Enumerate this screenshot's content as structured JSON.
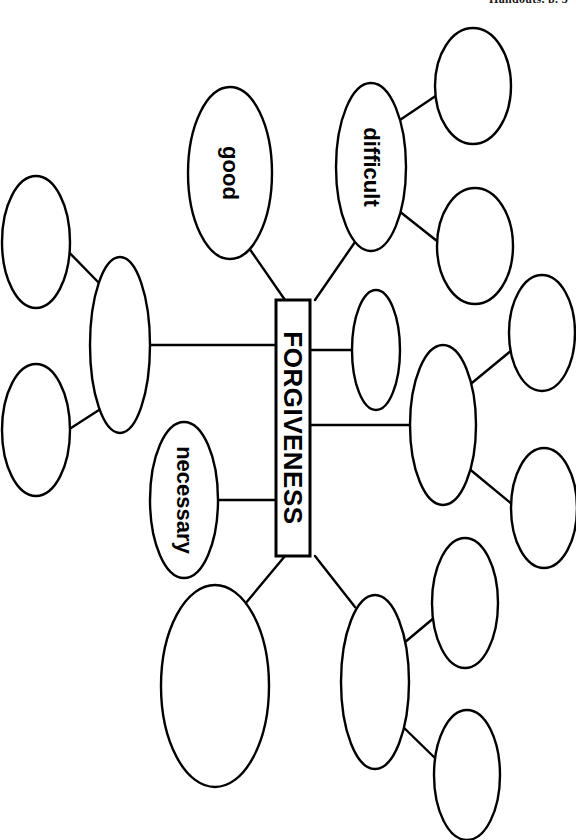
{
  "header": {
    "running_text": "Handouts, p. 3"
  },
  "diagram": {
    "type": "concept-map",
    "title": "FORGIVENESS",
    "orientation": "rotated-90-clockwise",
    "center": {
      "id": "center",
      "label": "FORGIVENESS",
      "shape": "rectangle",
      "x": 293,
      "y": 428,
      "w": 34,
      "h": 256,
      "font_size": 26
    },
    "nodes": [
      {
        "id": "good",
        "label": "good",
        "cx": 230,
        "cy": 173,
        "rx": 42,
        "ry": 86,
        "font_size": 22,
        "filled": false
      },
      {
        "id": "difficult",
        "label": "difficult",
        "cx": 371,
        "cy": 167,
        "rx": 35,
        "ry": 84,
        "font_size": 22,
        "filled": false
      },
      {
        "id": "necessary",
        "label": "necessary",
        "cx": 184,
        "cy": 500,
        "rx": 34,
        "ry": 78,
        "font_size": 22,
        "filled": false
      },
      {
        "id": "d1",
        "label": "",
        "cx": 473,
        "cy": 86,
        "rx": 38,
        "ry": 58,
        "font_size": 0,
        "filled": false
      },
      {
        "id": "d2",
        "label": "",
        "cx": 475,
        "cy": 246,
        "rx": 38,
        "ry": 58,
        "font_size": 0,
        "filled": false
      },
      {
        "id": "l1",
        "label": "",
        "cx": 120,
        "cy": 345,
        "rx": 30,
        "ry": 88,
        "font_size": 0,
        "filled": false
      },
      {
        "id": "l2",
        "label": "",
        "cx": 36,
        "cy": 242,
        "rx": 34,
        "ry": 66,
        "font_size": 0,
        "filled": false
      },
      {
        "id": "l3",
        "label": "",
        "cx": 36,
        "cy": 430,
        "rx": 34,
        "ry": 66,
        "font_size": 0,
        "filled": false
      },
      {
        "id": "r1",
        "label": "",
        "cx": 376,
        "cy": 350,
        "rx": 24,
        "ry": 60,
        "font_size": 0,
        "filled": false
      },
      {
        "id": "r2",
        "label": "",
        "cx": 443,
        "cy": 425,
        "rx": 33,
        "ry": 80,
        "font_size": 0,
        "filled": false
      },
      {
        "id": "r3",
        "label": "",
        "cx": 542,
        "cy": 333,
        "rx": 33,
        "ry": 58,
        "font_size": 0,
        "filled": false
      },
      {
        "id": "r4",
        "label": "",
        "cx": 544,
        "cy": 508,
        "rx": 33,
        "ry": 60,
        "font_size": 0,
        "filled": false
      },
      {
        "id": "b1",
        "label": "",
        "cx": 215,
        "cy": 686,
        "rx": 54,
        "ry": 101,
        "font_size": 0,
        "filled": false
      },
      {
        "id": "b2",
        "label": "",
        "cx": 375,
        "cy": 682,
        "rx": 34,
        "ry": 87,
        "font_size": 0,
        "filled": false
      },
      {
        "id": "b3",
        "label": "",
        "cx": 465,
        "cy": 603,
        "rx": 33,
        "ry": 65,
        "font_size": 0,
        "filled": false
      },
      {
        "id": "b4",
        "label": "",
        "cx": 467,
        "cy": 775,
        "rx": 33,
        "ry": 65,
        "font_size": 0,
        "filled": false
      }
    ],
    "edges": [
      {
        "from": "center",
        "to": "good",
        "x1": 285,
        "y1": 300,
        "x2": 249,
        "y2": 248
      },
      {
        "from": "center",
        "to": "difficult",
        "x1": 315,
        "y1": 300,
        "x2": 355,
        "y2": 242
      },
      {
        "from": "center",
        "to": "l1",
        "x1": 276,
        "y1": 345,
        "x2": 150,
        "y2": 345
      },
      {
        "from": "center",
        "to": "necessary",
        "x1": 276,
        "y1": 500,
        "x2": 216,
        "y2": 500
      },
      {
        "from": "center",
        "to": "b1",
        "x1": 285,
        "y1": 556,
        "x2": 245,
        "y2": 604
      },
      {
        "from": "center",
        "to": "b2",
        "x1": 315,
        "y1": 556,
        "x2": 355,
        "y2": 607
      },
      {
        "from": "center",
        "to": "r1",
        "x1": 310,
        "y1": 350,
        "x2": 352,
        "y2": 350
      },
      {
        "from": "center",
        "to": "r2",
        "x1": 310,
        "y1": 425,
        "x2": 410,
        "y2": 425
      },
      {
        "from": "difficult",
        "to": "d1",
        "x1": 394,
        "y1": 124,
        "x2": 443,
        "y2": 91
      },
      {
        "from": "difficult",
        "to": "d2",
        "x1": 394,
        "y1": 207,
        "x2": 442,
        "y2": 245
      },
      {
        "from": "l1",
        "to": "l2",
        "x1": 99,
        "y1": 283,
        "x2": 57,
        "y2": 240
      },
      {
        "from": "l1",
        "to": "l3",
        "x1": 99,
        "y1": 410,
        "x2": 57,
        "y2": 437
      },
      {
        "from": "r2",
        "to": "r3",
        "x1": 467,
        "y1": 387,
        "x2": 512,
        "y2": 350
      },
      {
        "from": "r2",
        "to": "r4",
        "x1": 467,
        "y1": 467,
        "x2": 513,
        "y2": 505
      },
      {
        "from": "b2",
        "to": "b3",
        "x1": 398,
        "y1": 648,
        "x2": 435,
        "y2": 617
      },
      {
        "from": "b2",
        "to": "b4",
        "x1": 398,
        "y1": 722,
        "x2": 437,
        "y2": 760
      }
    ],
    "style": {
      "stroke": "#000000",
      "fill": "#ffffff",
      "node_stroke_width": 2.4,
      "edge_stroke_width": 2.4,
      "box_stroke_width": 3
    }
  }
}
